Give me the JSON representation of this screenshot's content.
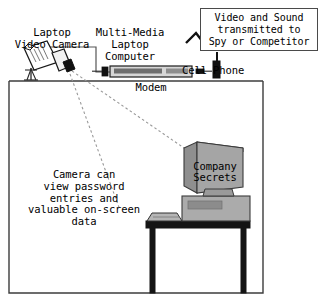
{
  "diagram": {
    "labels": {
      "camera": "Laptop\nVideo Camera",
      "laptop": "Multi-Media\nLaptop\nComputer",
      "cell_phone": "Cell Phone",
      "modem": "Modem",
      "monitor_screen": "Company\nSecrets",
      "caption": "Camera can\nview password\nentries and\nvaluable on-screen\ndata",
      "transmit_box": "Video and Sound\ntransmitted to\nSpy or Competitor"
    },
    "colors": {
      "ink": "#000000",
      "outline": "#4a4a4a",
      "room_wall": "#3c3c3c",
      "desk": "#1a1a1a",
      "monitor_body": "#9c9c9c",
      "monitor_light": "#b8b8b8",
      "monitor_dark": "#808080",
      "cpu_body": "#ababab",
      "cpu_slot": "#8c8c8c",
      "laptop_body": "#d6d6d6",
      "laptop_screen": "#6e6e6e",
      "camera_body": "#ffffff",
      "dashed_ray": "#8a8a8a"
    },
    "elements": [
      {
        "name": "video-camera",
        "kind": "tripod-mounted camcorder"
      },
      {
        "name": "laptop-computer",
        "kind": "multimedia laptop"
      },
      {
        "name": "cell-phone",
        "kind": "handset with antenna"
      },
      {
        "name": "signal-bolt",
        "kind": "radio transmission zigzag"
      },
      {
        "name": "transmit-callout",
        "kind": "text box"
      },
      {
        "name": "room-outline",
        "kind": "rectangle walls"
      },
      {
        "name": "desk",
        "kind": "table with two legs"
      },
      {
        "name": "crt-monitor",
        "kind": "monitor showing Company Secrets"
      },
      {
        "name": "computer-tower",
        "kind": "horizontal desktop case"
      },
      {
        "name": "keyboard",
        "kind": "keyboard on desk"
      },
      {
        "name": "sight-lines",
        "kind": "two dashed rays from camera to monitor"
      }
    ]
  }
}
